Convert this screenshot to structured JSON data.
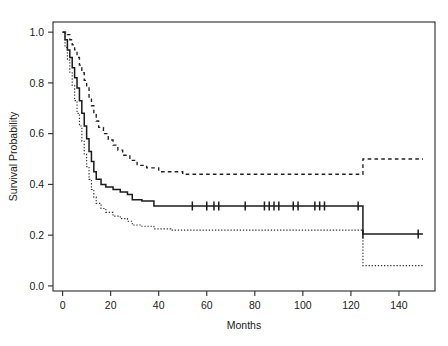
{
  "chart_data": {
    "type": "line",
    "title": "",
    "subtitle": "",
    "xlabel": "Months",
    "ylabel": "Survival Probability",
    "xlim": [
      -4,
      155
    ],
    "ylim": [
      -0.02,
      1.04
    ],
    "xticks": [
      0,
      20,
      40,
      60,
      80,
      100,
      120,
      140
    ],
    "xticklabels": [
      "0",
      "20",
      "40",
      "60",
      "80",
      "100",
      "120",
      "140"
    ],
    "yticks": [
      0.0,
      0.2,
      0.4,
      0.6,
      0.8,
      1.0
    ],
    "yticklabels": [
      "0.0",
      "0.2",
      "0.4",
      "0.6",
      "0.8",
      "1.0"
    ],
    "grid": false,
    "legend": "none",
    "frame": "box",
    "series": [
      {
        "name": "Kaplan-Meier estimate",
        "style": "solid",
        "color": "#1b1b1b",
        "steps": [
          [
            0,
            1.0
          ],
          [
            1,
            0.97
          ],
          [
            2,
            0.93
          ],
          [
            3,
            0.9
          ],
          [
            4,
            0.86
          ],
          [
            5,
            0.82
          ],
          [
            6,
            0.78
          ],
          [
            7,
            0.73
          ],
          [
            8,
            0.68
          ],
          [
            9,
            0.63
          ],
          [
            10,
            0.58
          ],
          [
            11,
            0.53
          ],
          [
            12,
            0.49
          ],
          [
            13,
            0.45
          ],
          [
            14,
            0.42
          ],
          [
            16,
            0.4
          ],
          [
            18,
            0.39
          ],
          [
            21,
            0.38
          ],
          [
            24,
            0.37
          ],
          [
            27,
            0.36
          ],
          [
            29,
            0.34
          ],
          [
            33,
            0.335
          ],
          [
            38,
            0.315
          ],
          [
            124,
            0.315
          ],
          [
            125,
            0.205
          ],
          [
            150,
            0.205
          ]
        ]
      },
      {
        "name": "Upper 95% confidence limit",
        "style": "dashed",
        "color": "#222222",
        "steps": [
          [
            0,
            1.0
          ],
          [
            1,
            1.0
          ],
          [
            2,
            0.99
          ],
          [
            3,
            0.97
          ],
          [
            4,
            0.95
          ],
          [
            5,
            0.93
          ],
          [
            6,
            0.9
          ],
          [
            7,
            0.87
          ],
          [
            8,
            0.84
          ],
          [
            9,
            0.81
          ],
          [
            10,
            0.78
          ],
          [
            11,
            0.74
          ],
          [
            12,
            0.71
          ],
          [
            13,
            0.68
          ],
          [
            14,
            0.65
          ],
          [
            15,
            0.625
          ],
          [
            17,
            0.6
          ],
          [
            19,
            0.575
          ],
          [
            21,
            0.555
          ],
          [
            23,
            0.535
          ],
          [
            25,
            0.515
          ],
          [
            28,
            0.495
          ],
          [
            31,
            0.475
          ],
          [
            35,
            0.465
          ],
          [
            40,
            0.45
          ],
          [
            50,
            0.44
          ],
          [
            124,
            0.44
          ],
          [
            125,
            0.5
          ],
          [
            150,
            0.5
          ]
        ]
      },
      {
        "name": "Lower 95% confidence limit",
        "style": "dotted",
        "color": "#333333",
        "steps": [
          [
            0,
            1.0
          ],
          [
            1,
            0.94
          ],
          [
            2,
            0.89
          ],
          [
            3,
            0.84
          ],
          [
            4,
            0.79
          ],
          [
            5,
            0.73
          ],
          [
            6,
            0.68
          ],
          [
            7,
            0.63
          ],
          [
            8,
            0.57
          ],
          [
            9,
            0.52
          ],
          [
            10,
            0.47
          ],
          [
            11,
            0.42
          ],
          [
            12,
            0.38
          ],
          [
            13,
            0.35
          ],
          [
            14,
            0.325
          ],
          [
            16,
            0.305
          ],
          [
            18,
            0.29
          ],
          [
            21,
            0.275
          ],
          [
            24,
            0.265
          ],
          [
            27,
            0.255
          ],
          [
            29,
            0.24
          ],
          [
            33,
            0.235
          ],
          [
            38,
            0.225
          ],
          [
            45,
            0.22
          ],
          [
            124,
            0.22
          ],
          [
            125,
            0.08
          ],
          [
            150,
            0.08
          ]
        ]
      }
    ],
    "censored_points": [
      [
        54,
        0.315
      ],
      [
        60,
        0.315
      ],
      [
        63,
        0.315
      ],
      [
        65,
        0.315
      ],
      [
        76,
        0.315
      ],
      [
        84,
        0.315
      ],
      [
        86,
        0.315
      ],
      [
        88,
        0.315
      ],
      [
        90,
        0.315
      ],
      [
        96,
        0.315
      ],
      [
        98,
        0.315
      ],
      [
        105,
        0.315
      ],
      [
        107,
        0.315
      ],
      [
        109,
        0.315
      ],
      [
        123,
        0.315
      ],
      [
        125,
        0.205
      ],
      [
        148,
        0.205
      ]
    ]
  }
}
